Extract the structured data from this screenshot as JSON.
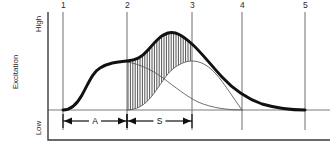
{
  "chart_data": {
    "type": "line",
    "title": "",
    "xlabel": "",
    "ylabel": "Excitation",
    "y_high_label": "High",
    "y_low_label": "Low",
    "grid": false,
    "legend": false,
    "axis": {
      "y_axis_x": 48,
      "y_axis_top": 12,
      "y_axis_bottom": 140,
      "baseline_y": 110,
      "bottom_axis_y": 140,
      "plot_left": 48,
      "plot_right": 330
    },
    "markers": [
      {
        "label": "1",
        "x": 63
      },
      {
        "label": "2",
        "x": 127
      },
      {
        "label": "3",
        "x": 192
      },
      {
        "label": "4",
        "x": 242
      },
      {
        "label": "5",
        "x": 305
      }
    ],
    "dimensions": [
      {
        "label": "A",
        "from_marker": "1",
        "to_marker": "2",
        "x_start": 63,
        "x_end": 127,
        "y": 121
      },
      {
        "label": "S",
        "from_marker": "2",
        "to_marker": "3",
        "x_start": 127,
        "x_end": 192,
        "y": 121
      }
    ],
    "series": [
      {
        "name": "total-excitation",
        "style": "thick",
        "path": "M 63,110 C 70,110 76,106 82,95 C 89,82 93,72 100,68 C 108,63 116,62 127,61 C 136,60 141,58 148,50 C 155,42 161,35 168,33 C 176,31 183,36 192,44 C 201,52 210,64 222,77 C 234,90 248,99 262,104 C 276,108 292,110 305,110"
      },
      {
        "name": "secondary-excitation-rising",
        "style": "thin",
        "path": "M 127,110 C 136,110 144,106 152,96 C 160,86 166,74 174,68 C 181,63 187,61 192,61 C 200,61 208,65 216,74 C 224,83 232,96 242,110"
      },
      {
        "name": "secondary-excitation-falling",
        "style": "thin",
        "path": "M 127,62 C 140,64 152,70 163,78 C 175,87 186,96 198,102 C 212,108 228,110 242,110"
      }
    ],
    "hatched_region": {
      "name": "shaded-difference-area",
      "x_start": 127,
      "x_end": 192,
      "description": "vertical hatching between rising secondary curve and thick total curve"
    }
  }
}
